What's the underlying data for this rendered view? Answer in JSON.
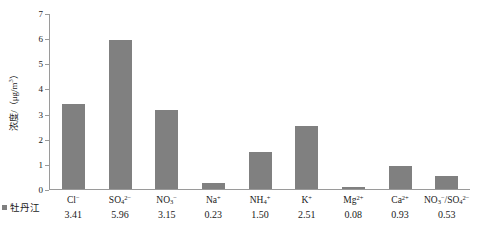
{
  "chart_data": {
    "type": "bar",
    "title": "",
    "xlabel": "",
    "ylabel": "浓度/（μg/m³）",
    "ylim": [
      0,
      7
    ],
    "yticks": [
      0,
      1,
      2,
      3,
      4,
      5,
      6,
      7
    ],
    "grid": false,
    "legend": {
      "position": "bottom-left",
      "label": "牡丹江",
      "color": "#808080"
    },
    "categories": [
      "Cl⁻",
      "SO₄²⁻",
      "NO₃⁻",
      "Na⁺",
      "NH₄⁺",
      "K⁺",
      "Mg²⁺",
      "Ca²⁺",
      "NO₃⁻/SO₄²⁻"
    ],
    "values": [
      3.41,
      5.96,
      3.15,
      0.23,
      1.5,
      2.51,
      0.08,
      0.93,
      0.53
    ],
    "series": [
      {
        "name": "牡丹江",
        "color": "#808080",
        "values": [
          3.41,
          5.96,
          3.15,
          0.23,
          1.5,
          2.51,
          0.08,
          0.93,
          0.53
        ]
      }
    ]
  },
  "axis": {
    "y_title_main": "浓度/（μg/m",
    "y_title_sup": "3",
    "y_title_tail": "）",
    "ticklabels": [
      "7",
      "6",
      "5",
      "4",
      "3",
      "2",
      "1",
      "0"
    ]
  },
  "xlabels": [
    {
      "base": "Cl",
      "sup": "−",
      "sub": "",
      "value": "3.41"
    },
    {
      "base": "SO",
      "sub": "4",
      "sup": "2−",
      "value": "5.96"
    },
    {
      "base": "NO",
      "sub": "3",
      "sup": "−",
      "value": "3.15"
    },
    {
      "base": "Na",
      "sub": "",
      "sup": "+",
      "value": "0.23"
    },
    {
      "base": "NH",
      "sub": "4",
      "sup": "+",
      "value": "1.50"
    },
    {
      "base": "K",
      "sub": "",
      "sup": "+",
      "value": "2.51"
    },
    {
      "base": "Mg",
      "sub": "",
      "sup": "2+",
      "value": "0.08"
    },
    {
      "base": "Ca",
      "sub": "",
      "sup": "2+",
      "value": "0.93"
    },
    {
      "base": "ratio",
      "sub": "",
      "sup": "",
      "value": "0.53"
    }
  ],
  "legend": {
    "label": "牡丹江"
  },
  "caption": ""
}
